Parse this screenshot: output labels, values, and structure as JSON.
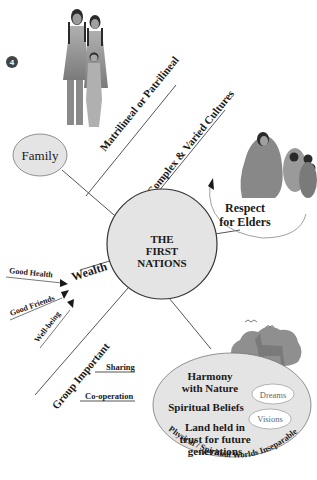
{
  "badge": {
    "number": "4"
  },
  "center": {
    "line1": "THE",
    "line2": "FIRST",
    "line3": "NATIONS"
  },
  "branches": {
    "matrilineal": "Matrilineal or Patrilineal",
    "complex": "Complex & Varied Cultures",
    "wealth": "Wealth",
    "group": "Group Important"
  },
  "family": {
    "label": "Family"
  },
  "respect": {
    "line1": "Respect",
    "line2": "for Elders"
  },
  "wealth_items": {
    "health": "Good Health",
    "friends": "Good Friends",
    "wellbeing": "Well-being"
  },
  "group_items": {
    "sharing": "Sharing",
    "cooperation": "Co-operation"
  },
  "nature": {
    "harmony1": "Harmony",
    "harmony2": "with Nature",
    "spiritual": "Spiritual Beliefs",
    "land1": "Land held in",
    "land2": "trust for future",
    "land3": "generations",
    "dreams": "Dreams",
    "visions": "Visions",
    "arc_text": "Physical / Spiritual Worlds Inseparable"
  },
  "colors": {
    "ellipse_fill": "#e4e4e4",
    "line": "#555555",
    "figure": "#8a8a8a",
    "text": "#1a1a1a"
  }
}
